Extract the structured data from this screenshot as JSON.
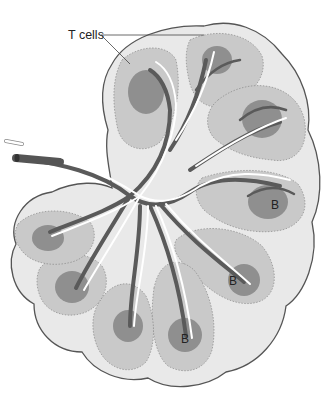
{
  "diagram": {
    "labels": {
      "t_cells": "T cells",
      "b1": "B",
      "b2": "B",
      "b3": "B"
    },
    "colors": {
      "capsule_fill": "#e9e9e9",
      "capsule_stroke": "#555555",
      "lobule_fill": "#c4c4c4",
      "follicle_fill": "#8f8f8f",
      "vessel_dark": "#5a5a5a",
      "vessel_light": "#ffffff"
    }
  }
}
